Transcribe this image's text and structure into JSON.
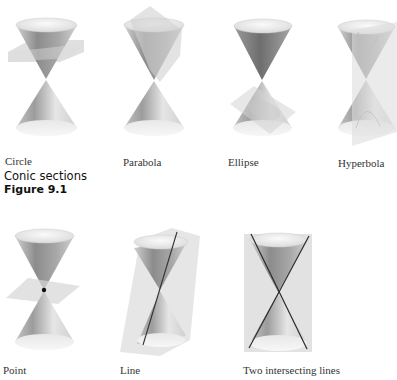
{
  "figure": {
    "caption_title": "Conic sections",
    "caption_number": "Figure 9.1"
  },
  "panels": [
    {
      "id": "circle",
      "label": "Circle",
      "cut": "horizontal plane"
    },
    {
      "id": "parabola",
      "label": "Parabola",
      "cut": "plane parallel to side"
    },
    {
      "id": "ellipse",
      "label": "Ellipse",
      "cut": "tilted plane"
    },
    {
      "id": "hyperbola",
      "label": "Hyperbola",
      "cut": "vertical plane"
    },
    {
      "id": "point",
      "label": "Point",
      "cut": "horizontal plane through apex"
    },
    {
      "id": "line",
      "label": "Line",
      "cut": "tangent plane"
    },
    {
      "id": "two-lines",
      "label": "Two intersecting lines",
      "cut": "vertical plane through apex"
    }
  ],
  "colors": {
    "cone_dark": "#8a8a8a",
    "cone_light": "#f2f2f2",
    "plane": "#d9d9d9",
    "line": "#222222"
  }
}
